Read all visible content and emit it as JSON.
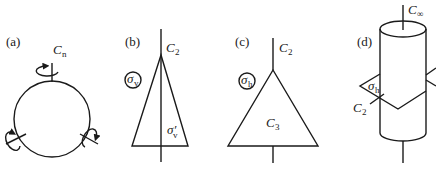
{
  "panels": [
    {
      "id": "a",
      "label": "(a)",
      "axis_label": "C",
      "axis_sub": "n",
      "shape": "circle"
    },
    {
      "id": "b",
      "label": "(b)",
      "axis_label": "C",
      "axis_sub": "2",
      "shape": "isosceles-triangle",
      "plane_circled": "σ",
      "plane_circled_sub": "v",
      "plane_other": "σ′",
      "plane_other_sub": "v"
    },
    {
      "id": "c",
      "label": "(c)",
      "axis_label": "C",
      "axis_sub": "2",
      "shape": "equilateral-triangle",
      "plane_circled": "σ",
      "plane_circled_sub": "h",
      "inner_axis": "C",
      "inner_axis_sub": "3"
    },
    {
      "id": "d",
      "label": "(d)",
      "axis_label": "C",
      "axis_sub": "∞",
      "shape": "cylinder",
      "plane": "σ",
      "plane_sub": "h",
      "perp_axis": "C",
      "perp_axis_sub": "2"
    }
  ]
}
